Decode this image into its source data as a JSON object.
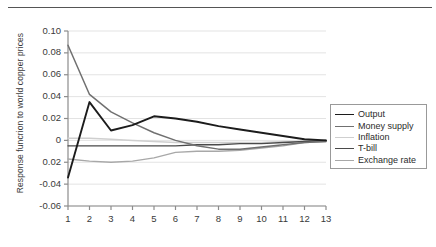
{
  "chart_data": {
    "type": "line",
    "title": "",
    "xlabel": "",
    "ylabel": "Response funcrion to world copper prices",
    "x": [
      1,
      2,
      3,
      4,
      5,
      6,
      7,
      8,
      9,
      10,
      11,
      12,
      13
    ],
    "xlim": [
      1,
      13
    ],
    "ylim": [
      -0.06,
      0.1
    ],
    "yticks": [
      0.1,
      0.08,
      0.06,
      0.04,
      0.02,
      0,
      -0.02,
      -0.04,
      -0.06
    ],
    "ytick_labels": [
      "0.10",
      "0.08",
      "0.06",
      "0.04",
      "0.02",
      "0",
      "0.02",
      "-0.04",
      "-0.06"
    ],
    "xtick_labels": [
      "1",
      "2",
      "3",
      "4",
      "5",
      "6",
      "7",
      "8",
      "9",
      "10",
      "11",
      "12",
      "13"
    ],
    "grid": true,
    "grid_axis": "y",
    "legend_position": "center-right",
    "series": [
      {
        "name": "Output",
        "color": "#1c1c1c",
        "width": 1.9,
        "values": [
          -0.034,
          0.035,
          0.009,
          0.014,
          0.022,
          0.02,
          0.017,
          0.013,
          0.01,
          0.007,
          0.004,
          0.001,
          0.0
        ]
      },
      {
        "name": "Money supply",
        "color": "#707070",
        "width": 1.5,
        "values": [
          0.087,
          0.042,
          0.026,
          0.016,
          0.007,
          0.0,
          -0.005,
          -0.008,
          -0.008,
          -0.006,
          -0.004,
          -0.002,
          -0.001
        ]
      },
      {
        "name": "Inflation",
        "color": "#cfcfcf",
        "width": 1.5,
        "values": [
          0.002,
          0.002,
          0.001,
          0.0,
          -0.001,
          -0.002,
          -0.002,
          -0.002,
          -0.002,
          -0.002,
          -0.001,
          -0.001,
          0.0
        ]
      },
      {
        "name": "T-bill",
        "color": "#4a4a4a",
        "width": 1.4,
        "values": [
          -0.005,
          -0.005,
          -0.005,
          -0.005,
          -0.005,
          -0.005,
          -0.004,
          -0.004,
          -0.003,
          -0.003,
          -0.002,
          -0.001,
          0.0
        ]
      },
      {
        "name": "Exchange rate",
        "color": "#a8a8a8",
        "width": 1.4,
        "values": [
          -0.017,
          -0.019,
          -0.02,
          -0.019,
          -0.016,
          -0.011,
          -0.01,
          -0.01,
          -0.009,
          -0.007,
          -0.005,
          -0.002,
          -0.001
        ]
      }
    ]
  },
  "legend": {
    "items": [
      {
        "label": "Output"
      },
      {
        "label": "Money supply"
      },
      {
        "label": "Inflation"
      },
      {
        "label": "T-bill"
      },
      {
        "label": "Exchange rate"
      }
    ]
  }
}
